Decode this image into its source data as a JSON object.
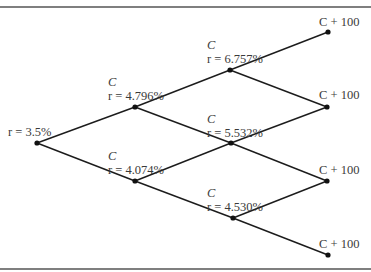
{
  "diagram": {
    "type": "binomial-interest-rate-tree",
    "root": {
      "id": "n0",
      "rate_label": "r = 3.5%",
      "rate": "3.5%"
    },
    "nodes": [
      {
        "id": "n1u",
        "level": 1,
        "cash_flow": "C",
        "rate_label": "r = 4.796%",
        "rate": "4.796%"
      },
      {
        "id": "n1d",
        "level": 1,
        "cash_flow": "C",
        "rate_label": "r = 4.074%",
        "rate": "4.074%"
      },
      {
        "id": "n2uu",
        "level": 2,
        "cash_flow": "C",
        "rate_label": "r = 6.757%",
        "rate": "6.757%"
      },
      {
        "id": "n2ud",
        "level": 2,
        "cash_flow": "C",
        "rate_label": "r = 5.532%",
        "rate": "5.532%"
      },
      {
        "id": "n2dd",
        "level": 2,
        "cash_flow": "C",
        "rate_label": "r = 4.530%",
        "rate": "4.530%"
      },
      {
        "id": "n3a",
        "level": 3,
        "cash_flow": "C + 100"
      },
      {
        "id": "n3b",
        "level": 3,
        "cash_flow": "C + 100"
      },
      {
        "id": "n3c",
        "level": 3,
        "cash_flow": "C + 100"
      },
      {
        "id": "n3d",
        "level": 3,
        "cash_flow": "C + 100"
      }
    ],
    "edges": [
      [
        "n0",
        "n1u"
      ],
      [
        "n0",
        "n1d"
      ],
      [
        "n1u",
        "n2uu"
      ],
      [
        "n1u",
        "n2ud"
      ],
      [
        "n1d",
        "n2ud"
      ],
      [
        "n1d",
        "n2dd"
      ],
      [
        "n2uu",
        "n3a"
      ],
      [
        "n2uu",
        "n3b"
      ],
      [
        "n2ud",
        "n3b"
      ],
      [
        "n2ud",
        "n3c"
      ],
      [
        "n2dd",
        "n3c"
      ],
      [
        "n2dd",
        "n3d"
      ]
    ]
  },
  "labels": {
    "root_rate": "r = 3.5%",
    "n1u_c": "C",
    "n1u_rate": "r = 4.796%",
    "n1d_c": "C",
    "n1d_rate": "r = 4.074%",
    "n2uu_c": "C",
    "n2uu_rate": "r = 6.757%",
    "n2ud_c": "C",
    "n2ud_rate": "r = 5.532%",
    "n2dd_c": "C",
    "n2dd_rate": "r = 4.530%",
    "n3a_cf": "C + 100",
    "n3b_cf": "C + 100",
    "n3c_cf": "C + 100",
    "n3d_cf": "C + 100"
  }
}
